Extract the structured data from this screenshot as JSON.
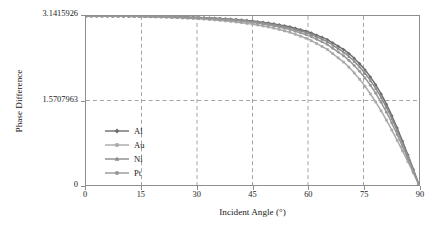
{
  "chart_data": {
    "type": "line",
    "title": "",
    "subtitle": "",
    "xlabel": "Incident Angle (°)",
    "ylabel": "Phase Difference",
    "xlim": [
      0,
      90
    ],
    "ylim": [
      0,
      3.1415926
    ],
    "xticks": [
      0,
      15,
      30,
      45,
      60,
      75,
      90
    ],
    "xticklabels": [
      "0",
      "15",
      "30",
      "45",
      "60",
      "75",
      "90"
    ],
    "yticks": [
      0,
      1.5707963,
      3.1415926
    ],
    "yticklabels": [
      "0",
      "1.5707963",
      "3.1415926"
    ],
    "grid": true,
    "grid_style": "dashed",
    "legend_position": "lower-left-inside",
    "legend_frame": false,
    "x": [
      0,
      5,
      10,
      15,
      20,
      25,
      30,
      35,
      40,
      45,
      50,
      55,
      60,
      65,
      70,
      72,
      74,
      76,
      78,
      80,
      82,
      84,
      86,
      88,
      90
    ],
    "series": [
      {
        "name": "Al",
        "marker": "diamond",
        "color": "#6e6e6e",
        "values": [
          3.1415926,
          3.1411,
          3.1397,
          3.137,
          3.1325,
          3.1256,
          3.1153,
          3.1004,
          3.079,
          3.0484,
          3.0046,
          2.9414,
          2.849,
          2.7117,
          2.5028,
          2.388,
          2.252,
          2.09,
          1.896,
          1.664,
          1.39,
          1.076,
          0.735,
          0.38,
          0.0
        ]
      },
      {
        "name": "Au",
        "marker": "square",
        "color": "#a9a9a9",
        "values": [
          3.1415926,
          3.1404,
          3.1368,
          3.1306,
          3.1214,
          3.1086,
          3.0911,
          3.0674,
          3.035,
          2.9905,
          2.9286,
          2.841,
          2.715,
          2.532,
          2.264,
          2.123,
          1.962,
          1.78,
          1.576,
          1.351,
          1.106,
          0.844,
          0.572,
          0.293,
          0.0
        ]
      },
      {
        "name": "Ni",
        "marker": "triangle",
        "color": "#8a8a8a",
        "values": [
          3.1415926,
          3.1409,
          3.139,
          3.1356,
          3.1303,
          3.1224,
          3.111,
          3.0946,
          3.0712,
          3.0379,
          2.9903,
          2.9218,
          2.8221,
          2.6748,
          2.4532,
          2.333,
          2.192,
          2.026,
          1.83,
          1.6,
          1.332,
          1.029,
          0.702,
          0.362,
          0.0
        ]
      },
      {
        "name": "Pt",
        "marker": "circle",
        "color": "#979797",
        "values": [
          3.1415926,
          3.1407,
          3.1383,
          3.1342,
          3.1279,
          3.1187,
          3.1055,
          3.0868,
          3.0603,
          3.0228,
          2.9695,
          2.8934,
          2.7831,
          2.6219,
          2.3828,
          2.256,
          2.109,
          1.938,
          1.739,
          1.509,
          1.246,
          0.954,
          0.645,
          0.33,
          0.0
        ]
      }
    ]
  },
  "legend": {
    "items": [
      {
        "label": "Al"
      },
      {
        "label": "Au"
      },
      {
        "label": "Ni"
      },
      {
        "label": "Pt"
      }
    ]
  }
}
